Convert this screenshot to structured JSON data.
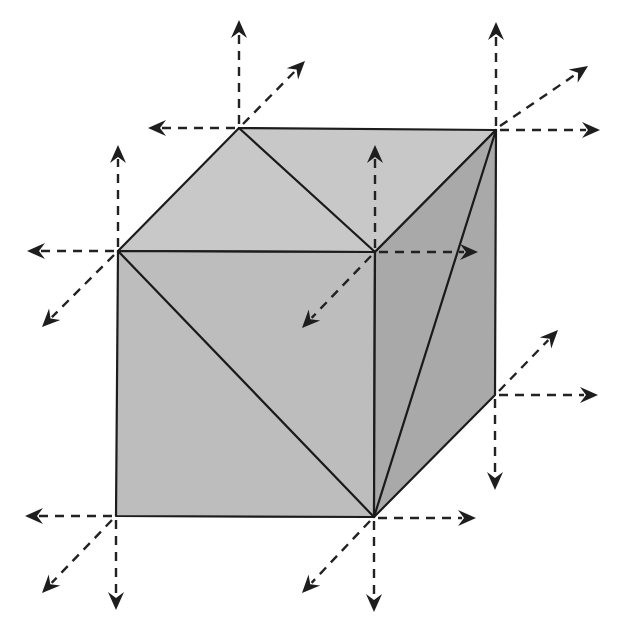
{
  "diagram": {
    "title": "",
    "colors": {
      "background": "#ffffff",
      "top_face": "#c8c8c8",
      "front_face": "#bdbdbd",
      "right_face": "#a9a9a9",
      "edge": "#1a1a1a",
      "arrow": "#222222"
    },
    "vertices": {
      "top_back_left": [
        239,
        128
      ],
      "top_back_right": [
        496,
        130
      ],
      "top_front_left": [
        118,
        251
      ],
      "top_front_right": [
        375,
        252
      ],
      "bottom_front_left": [
        116,
        516
      ],
      "bottom_front_right": [
        374,
        517
      ],
      "bottom_back_right": [
        495,
        395
      ]
    },
    "faces": [
      {
        "name": "top-face",
        "points": "239,128 496,130 375,252 118,251",
        "fill": "#c8c8c8"
      },
      {
        "name": "front-face",
        "points": "118,251 375,252 374,517 116,516",
        "fill": "#bdbdbd"
      },
      {
        "name": "right-face",
        "points": "375,252 496,130 495,395 374,517",
        "fill": "#a9a9a9"
      }
    ],
    "diagonals": [
      {
        "name": "top-diagonal",
        "from": [
          239,
          128
        ],
        "to": [
          375,
          252
        ]
      },
      {
        "name": "front-diagonal",
        "from": [
          118,
          251
        ],
        "to": [
          374,
          517
        ]
      },
      {
        "name": "right-diagonal",
        "from": [
          496,
          130
        ],
        "to": [
          374,
          517
        ]
      }
    ],
    "arrows": [
      {
        "name": "arrow-a-up",
        "from": [
          239,
          124
        ],
        "to": [
          239,
          20
        ]
      },
      {
        "name": "arrow-a-left",
        "from": [
          235,
          128
        ],
        "to": [
          148,
          128
        ]
      },
      {
        "name": "arrow-a-diag",
        "from": [
          243,
          124
        ],
        "to": [
          305,
          61
        ]
      },
      {
        "name": "arrow-b-up",
        "from": [
          496,
          126
        ],
        "to": [
          496,
          22
        ]
      },
      {
        "name": "arrow-b-right",
        "from": [
          500,
          130
        ],
        "to": [
          600,
          130
        ]
      },
      {
        "name": "arrow-b-diag",
        "from": [
          500,
          126
        ],
        "to": [
          588,
          66
        ]
      },
      {
        "name": "arrow-c-up",
        "from": [
          118,
          247
        ],
        "to": [
          118,
          145
        ]
      },
      {
        "name": "arrow-c-left",
        "from": [
          114,
          251
        ],
        "to": [
          27,
          251
        ]
      },
      {
        "name": "arrow-c-diag",
        "from": [
          114,
          255
        ],
        "to": [
          42,
          327
        ]
      },
      {
        "name": "arrow-d-up",
        "from": [
          375,
          248
        ],
        "to": [
          375,
          145
        ]
      },
      {
        "name": "arrow-d-right",
        "from": [
          379,
          252
        ],
        "to": [
          478,
          252
        ]
      },
      {
        "name": "arrow-d-diag",
        "from": [
          371,
          256
        ],
        "to": [
          302,
          328
        ]
      },
      {
        "name": "arrow-e-left",
        "from": [
          112,
          516
        ],
        "to": [
          25,
          516
        ]
      },
      {
        "name": "arrow-e-down",
        "from": [
          116,
          520
        ],
        "to": [
          116,
          610
        ]
      },
      {
        "name": "arrow-e-diag",
        "from": [
          112,
          520
        ],
        "to": [
          42,
          593
        ]
      },
      {
        "name": "arrow-f-right",
        "from": [
          378,
          518
        ],
        "to": [
          476,
          518
        ]
      },
      {
        "name": "arrow-f-down",
        "from": [
          374,
          521
        ],
        "to": [
          374,
          612
        ]
      },
      {
        "name": "arrow-f-diag",
        "from": [
          370,
          521
        ],
        "to": [
          302,
          593
        ]
      },
      {
        "name": "arrow-g-right",
        "from": [
          499,
          395
        ],
        "to": [
          598,
          395
        ]
      },
      {
        "name": "arrow-g-down",
        "from": [
          495,
          399
        ],
        "to": [
          495,
          490
        ]
      },
      {
        "name": "arrow-g-diag",
        "from": [
          499,
          391
        ],
        "to": [
          558,
          330
        ]
      }
    ]
  }
}
